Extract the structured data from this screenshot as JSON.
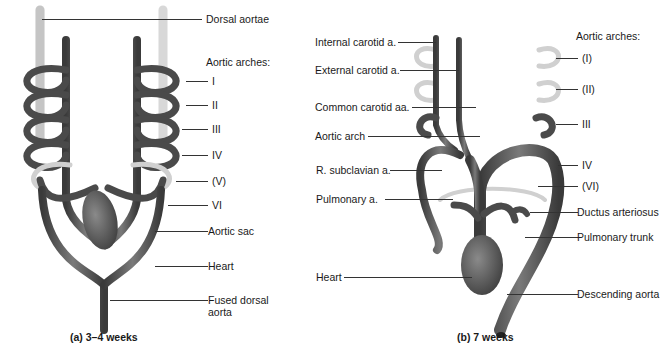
{
  "panel_a": {
    "caption": "(a) 3–4 weeks",
    "labels": {
      "dorsal_aortae": "Dorsal aortae",
      "aortic_arches_title": "Aortic arches:",
      "arch_1": "I",
      "arch_2": "II",
      "arch_3": "III",
      "arch_4": "IV",
      "arch_5": "(V)",
      "arch_6": "VI",
      "aortic_sac": "Aortic sac",
      "heart": "Heart",
      "fused_dorsal_aorta_line1": "Fused dorsal",
      "fused_dorsal_aorta_line2": "aorta"
    }
  },
  "panel_b": {
    "caption": "(b) 7 weeks",
    "labels": {
      "internal_carotid": "Internal carotid a.",
      "external_carotid": "External carotid a.",
      "common_carotid": "Common carotid aa.",
      "aortic_arch": "Aortic arch",
      "r_subclavian": "R. subclavian a.",
      "pulmonary_a": "Pulmonary a.",
      "heart": "Heart",
      "aortic_arches_title": "Aortic arches:",
      "arch_1": "(I)",
      "arch_2": "(II)",
      "arch_3": "III",
      "arch_4": "IV",
      "arch_6": "(VI)",
      "ductus_arteriosus": "Ductus arteriosus",
      "pulmonary_trunk": "Pulmonary trunk",
      "descending_aorta": "Descending aorta"
    }
  },
  "colors": {
    "vessel_dark": "#4a4a4a",
    "vessel_light": "#d4d4d4",
    "leader": "#333333"
  }
}
